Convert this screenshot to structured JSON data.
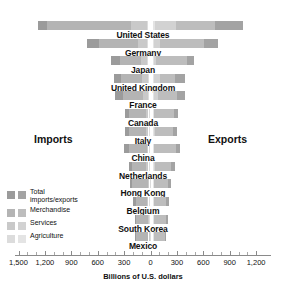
{
  "chart_data": {
    "type": "bar",
    "title": "",
    "subtitle": "",
    "xlabel": "Billions of U.S. dollars",
    "ylabel": "",
    "orientation": "horizontal-diverging",
    "grid": false,
    "legend_position": "left-inner",
    "axis": {
      "left_label": "Imports",
      "right_label": "Exports",
      "center_value": 0,
      "left_max": 1500,
      "right_max": 1200,
      "tick_interval": 300,
      "minor_tick_interval": 100,
      "tick_labels_left": [
        "1,500",
        "1,200",
        "900",
        "600",
        "300"
      ],
      "tick_labels_center": "0",
      "tick_labels_right": [
        "300",
        "600",
        "900",
        "1,200"
      ]
    },
    "series_names": [
      "Total imports/exports",
      "Merchandise",
      "Services",
      "Agriculture"
    ],
    "categories": [
      "United States",
      "Germany",
      "Japan",
      "United Kingdom",
      "France",
      "Canada",
      "Italy",
      "China",
      "Netherlands",
      "Hong Kong",
      "Belgium",
      "South Korea",
      "Mexico"
    ],
    "imports": {
      "total": [
        1280,
        720,
        450,
        420,
        400,
        290,
        290,
        300,
        250,
        230,
        200,
        180,
        180
      ],
      "merchandise": [
        1180,
        580,
        350,
        330,
        310,
        240,
        240,
        250,
        205,
        210,
        170,
        160,
        170
      ],
      "services": [
        220,
        140,
        110,
        95,
        80,
        50,
        55,
        40,
        50,
        25,
        40,
        30,
        20
      ],
      "agriculture": [
        45,
        40,
        45,
        25,
        25,
        15,
        20,
        15,
        20,
        10,
        15,
        15,
        10
      ]
    },
    "exports": {
      "total": [
        1050,
        770,
        490,
        390,
        390,
        310,
        300,
        330,
        280,
        235,
        215,
        200,
        175
      ],
      "merchandise": [
        730,
        610,
        420,
        280,
        300,
        265,
        250,
        290,
        235,
        200,
        180,
        175,
        165
      ],
      "services": [
        290,
        110,
        65,
        110,
        85,
        45,
        50,
        40,
        50,
        35,
        35,
        25,
        12
      ],
      "agriculture": [
        55,
        35,
        8,
        20,
        40,
        30,
        20,
        15,
        25,
        8,
        15,
        5,
        8
      ]
    }
  },
  "legend": {
    "items": [
      {
        "label": "Total imports/exports",
        "import_color": "#9b9b9b",
        "export_color": "#a3a3a3"
      },
      {
        "label": "Merchandise",
        "import_color": "#b4b4b4",
        "export_color": "#bdbdbd"
      },
      {
        "label": "Services",
        "import_color": "#c9c9c9",
        "export_color": "#d2d2d2"
      },
      {
        "label": "Agriculture",
        "import_color": "#dcdcdc",
        "export_color": "#e4e4e4"
      }
    ]
  }
}
